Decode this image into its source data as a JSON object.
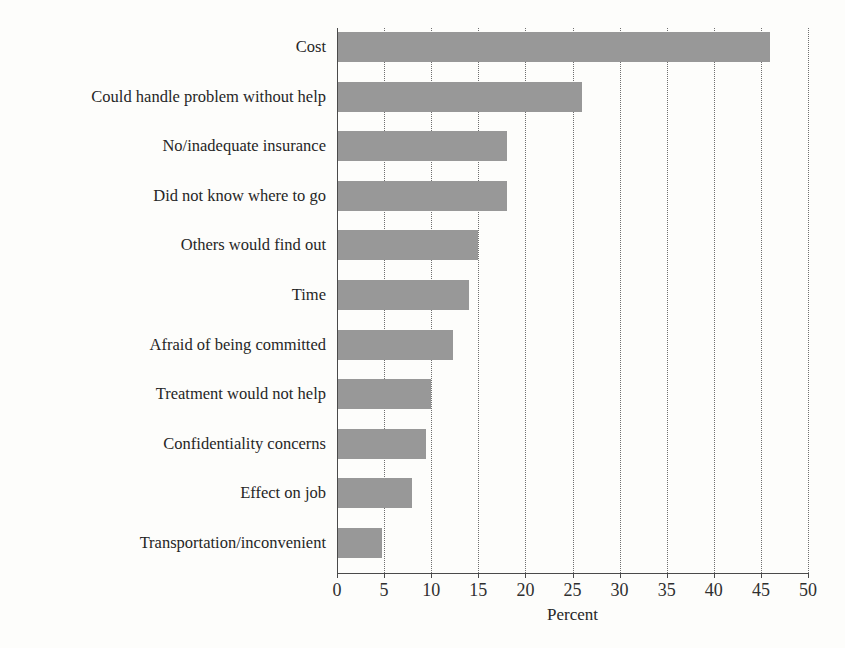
{
  "chart_data": {
    "type": "bar",
    "orientation": "horizontal",
    "title": "",
    "xlabel": "Percent",
    "ylabel": "",
    "xlim": [
      0,
      50
    ],
    "xticks": [
      0,
      5,
      10,
      15,
      20,
      25,
      30,
      35,
      40,
      45,
      50
    ],
    "xtick_labels": [
      "0",
      "5",
      "10",
      "15",
      "20",
      "25",
      "30",
      "35",
      "40",
      "45",
      "50"
    ],
    "grid": "vertical-dotted",
    "legend": "none",
    "bar_color": "#989898",
    "categories": [
      "Cost",
      "Could handle problem without help",
      "No/inadequate insurance",
      "Did not know where to go",
      "Others would find out",
      "Time",
      "Afraid of being committed",
      "Treatment would not help",
      "Confidentiality concerns",
      "Effect on job",
      "Transportation/inconvenient"
    ],
    "values": [
      46,
      26,
      18,
      18,
      15,
      14,
      12.3,
      10,
      9.5,
      8,
      4.8
    ]
  }
}
